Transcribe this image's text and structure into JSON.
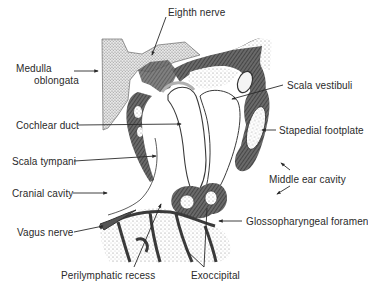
{
  "figure": {
    "labels": {
      "eighth_nerve": "Eighth nerve",
      "medulla_line1": "Medulla",
      "medulla_line2": "oblongata",
      "scala_vestibuli": "Scala vestibuli",
      "cochlear_duct": "Cochlear duct",
      "stapedial_footplate": "Stapedial footplate",
      "scala_tympani": "Scala tympani",
      "middle_ear_cavity": "Middle ear cavity",
      "cranial_cavity": "Cranial cavity",
      "glossopharyngeal_foramen": "Glossopharyngeal foramen",
      "vagus_nerve": "Vagus nerve",
      "perilymphatic_recess": "Perilymphatic recess",
      "exoccipital": "Exoccipital"
    },
    "colors": {
      "ink": "#2a2a2a",
      "bone_dark": "#4a4a4a",
      "stipple": "#9a9a9a",
      "background": "#ffffff"
    }
  }
}
